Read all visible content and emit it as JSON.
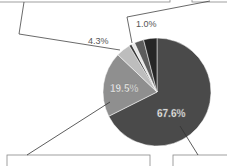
{
  "chart_data": {
    "type": "pie",
    "title": "",
    "start_angle_deg": 0,
    "direction": "clockwise",
    "slices": [
      {
        "label": "67.6%",
        "value": 67.6,
        "color": "#4a4a4a",
        "label_position": "inside"
      },
      {
        "label": "19.5%",
        "value": 19.5,
        "color": "#8f8f8f",
        "label_position": "inside"
      },
      {
        "label": "4.3%",
        "value": 4.3,
        "color": "#bdbdbd",
        "label_position": "outside"
      },
      {
        "label": "",
        "value": 0.8,
        "color": "#3a3a3a",
        "label_position": "none"
      },
      {
        "label": "1.0%",
        "value": 1.0,
        "color": "#e6e6e6",
        "label_position": "outside"
      },
      {
        "label": "",
        "value": 2.8,
        "color": "#5c5c5c",
        "label_position": "none"
      },
      {
        "label": "",
        "value": 4.0,
        "color": "#262626",
        "label_position": "none"
      }
    ],
    "legend": "callout boxes (cropped at image edges)"
  },
  "labels": {
    "big": "67.6%",
    "mid": "19.5%",
    "small1": "4.3%",
    "small2": "1.0%"
  }
}
